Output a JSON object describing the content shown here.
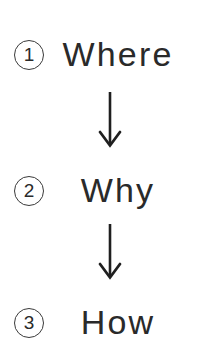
{
  "diagram": {
    "type": "vertical-flow",
    "background_color": "#ffffff",
    "text_color": "#2a2a2a",
    "arrow_color": "#1f1f1f",
    "badge_border_color": "#3a3a3a",
    "steps": [
      {
        "number": "1",
        "label": "Where"
      },
      {
        "number": "2",
        "label": "Why"
      },
      {
        "number": "3",
        "label": "How"
      }
    ],
    "connectors": [
      {
        "icon": "arrow-down-icon",
        "from": "Where",
        "to": "Why"
      },
      {
        "icon": "arrow-down-icon",
        "from": "Why",
        "to": "How"
      }
    ]
  }
}
